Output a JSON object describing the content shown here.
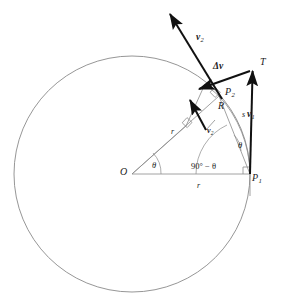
{
  "figure": {
    "kind": "physics-vector-diagram",
    "colors": {
      "thin_line": "#8a8a8a",
      "circle": "#8a8a8a",
      "vector": "#111111",
      "text": "#1a1a1a",
      "background": "#ffffff"
    },
    "geometry": {
      "circle_center_x": 132,
      "circle_center_y": 174,
      "circle_radius": 118,
      "point_O": [
        132,
        174
      ],
      "point_P1": [
        250,
        174
      ],
      "point_P2": [
        219,
        96
      ],
      "point_T": [
        253,
        67
      ]
    }
  },
  "labels": {
    "origin": "O",
    "point_1_base": "P",
    "point_1_sub": "1",
    "point_2_base": "P",
    "point_2_sub": "2",
    "tangent_point": "T",
    "radius_horizontal": "r",
    "radius_diagonal": "r",
    "chord": "R",
    "arc": "s",
    "velocity_1_base": "v",
    "velocity_1_sub": "1",
    "velocity_2_base": "v",
    "velocity_2_sub": "2",
    "velocity_2_inner_base": "v",
    "velocity_2_inner_sub": "2",
    "delta_v": "Δv",
    "angle_center": "θ",
    "angle_p1_inner": "θ",
    "angle_complement": "90° − θ"
  }
}
